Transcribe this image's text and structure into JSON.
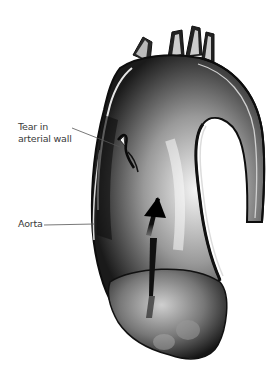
{
  "diagram": {
    "labels": {
      "tear": {
        "line1": "Tear in",
        "line2": "arterial wall"
      },
      "aorta": "Aorta"
    },
    "annotations": [
      {
        "name": "blood-flow-arrow",
        "direction": "up"
      }
    ],
    "colors": {
      "background": "#ffffff",
      "vessel_dark": "#1a1a1a",
      "vessel_light": "#e8e8e8",
      "label_text": "#3a3a3a",
      "leader_line": "#555555"
    }
  }
}
